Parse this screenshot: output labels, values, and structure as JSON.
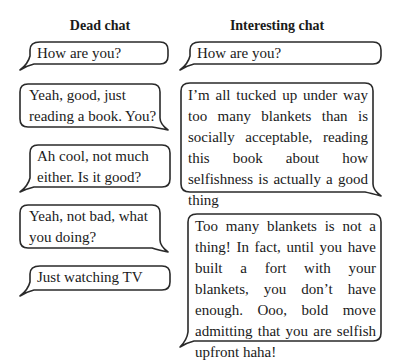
{
  "columns": [
    {
      "title": "Dead chat",
      "messages": [
        {
          "side": "left",
          "text": "How are you?"
        },
        {
          "side": "right",
          "text": "Yeah, good, just reading a book. You?"
        },
        {
          "side": "left",
          "text": "Ah cool, not much either. Is it good?"
        },
        {
          "side": "right",
          "text": "Yeah, not bad, what you doing?"
        },
        {
          "side": "left",
          "text": "Just watching TV"
        }
      ]
    },
    {
      "title": "Interesting chat",
      "messages": [
        {
          "side": "left",
          "text": "How are you?"
        },
        {
          "side": "right",
          "text": "I’m all tucked up under way too many blankets than is socially acceptable, reading this book about how selfishness is actually a good thing"
        },
        {
          "side": "left",
          "text": "Too many blankets is not a thing! In fact, until you have built a fort with your blankets, you don’t have enough. Ooo, bold move admitting that you are selfish upfront haha!"
        }
      ]
    }
  ],
  "colors": {
    "stroke": "#2a2a2a",
    "text": "#1a1a1a",
    "background": "#ffffff"
  }
}
